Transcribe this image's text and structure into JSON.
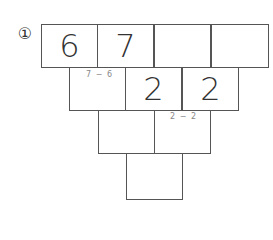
{
  "problem": {
    "number_label": "①",
    "rows": [
      [
        "6",
        "7",
        "",
        ""
      ],
      [
        "",
        "2",
        "2"
      ],
      [
        "",
        ""
      ],
      [
        ""
      ]
    ],
    "hints": [
      {
        "text": "7 − 6",
        "row": 1,
        "col": 0
      },
      {
        "text": "2 − 2",
        "row": 2,
        "col": 1
      }
    ]
  }
}
